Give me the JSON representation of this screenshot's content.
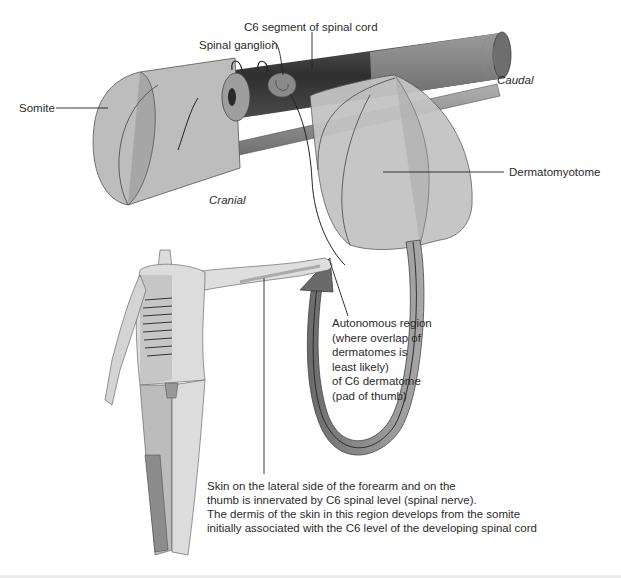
{
  "diagram": {
    "type": "anatomical-illustration",
    "colors": {
      "background": "#ffffff",
      "somite_fill": "#b9b9b9",
      "spinal_cord_dark": "#3c3c3c",
      "spinal_cord_light": "#8c8c8c",
      "dermatomyotome_fill": "#bcbcbc",
      "arrow_band": "#7a7a7a",
      "body_skin": "#dcdcdc",
      "dermatome_shade": "#a8a8a8",
      "leader_lines": "#222222"
    },
    "labels": {
      "spinal_cord_segment": "C6 segment of spinal cord",
      "spinal_ganglion": "Spinal ganglion",
      "somite": "Somite",
      "caudal": "Caudal",
      "cranial": "Cranial",
      "dermatomyotome": "Dermatomyotome",
      "autonomous_region": "Autonomous region\n(where overlap of\ndermatomes is\nleast likely)\nof C6 dermatome\n(pad of thumb)",
      "skin_caption": "Skin on the lateral side of the forearm and on the\nthumb is innervated by C6 spinal level (spinal nerve).\nThe dermis of the skin in this region develops from the somite\ninitially associated with the C6 level of the developing spinal cord"
    }
  }
}
